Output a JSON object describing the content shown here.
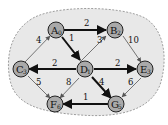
{
  "graph": {
    "region_fill": "#e8e8e8",
    "nodes": [
      {
        "id": "A",
        "dist": "0"
      },
      {
        "id": "B",
        "dist": "2"
      },
      {
        "id": "C",
        "dist": "3"
      },
      {
        "id": "D",
        "dist": "1"
      },
      {
        "id": "E",
        "dist": "3"
      },
      {
        "id": "F",
        "dist": "6"
      },
      {
        "id": "G",
        "dist": "5"
      }
    ],
    "edges": [
      {
        "from": "A",
        "to": "B",
        "weight": "2",
        "in_tree": true
      },
      {
        "from": "A",
        "to": "D",
        "weight": "1",
        "in_tree": true
      },
      {
        "from": "C",
        "to": "A",
        "weight": "4",
        "in_tree": false
      },
      {
        "from": "D",
        "to": "B",
        "weight": "3",
        "in_tree": false
      },
      {
        "from": "B",
        "to": "E",
        "weight": "10",
        "in_tree": false
      },
      {
        "from": "D",
        "to": "C",
        "weight": "2",
        "in_tree": true
      },
      {
        "from": "D",
        "to": "E",
        "weight": "2",
        "in_tree": true
      },
      {
        "from": "C",
        "to": "F",
        "weight": "5",
        "in_tree": false
      },
      {
        "from": "D",
        "to": "F",
        "weight": "8",
        "in_tree": false
      },
      {
        "from": "D",
        "to": "G",
        "weight": "4",
        "in_tree": true
      },
      {
        "from": "E",
        "to": "G",
        "weight": "6",
        "in_tree": false
      },
      {
        "from": "G",
        "to": "F",
        "weight": "1",
        "in_tree": true
      }
    ]
  }
}
